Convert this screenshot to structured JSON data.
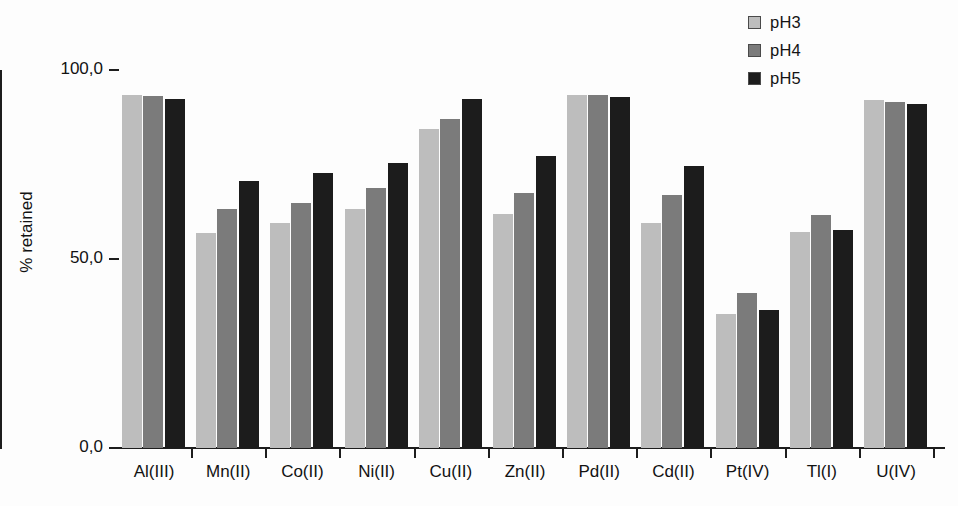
{
  "chart_data": {
    "type": "bar",
    "title": "",
    "xlabel": "",
    "ylabel": "% retained",
    "ylim": [
      0,
      100
    ],
    "ytick_labels": [
      "0,0",
      "50,0",
      "100,0"
    ],
    "ytick_values": [
      0,
      50,
      100
    ],
    "grid": false,
    "legend_position": "top-right",
    "categories": [
      "Al(III)",
      "Mn(II)",
      "Co(II)",
      "Ni(II)",
      "Cu(II)",
      "Zn(II)",
      "Pd(II)",
      "Cd(II)",
      "Pt(IV)",
      "Tl(I)",
      "U(IV)"
    ],
    "series": [
      {
        "name": "pH3",
        "color": "#bdbdbd",
        "values": [
          93.4,
          56.9,
          59.5,
          63.2,
          84.4,
          61.9,
          93.4,
          59.5,
          35.4,
          57.1,
          92.0
        ]
      },
      {
        "name": "pH4",
        "color": "#7b7b7b",
        "values": [
          93.0,
          63.2,
          64.8,
          68.8,
          87.0,
          67.5,
          93.4,
          66.9,
          41.0,
          61.6,
          91.5
        ]
      },
      {
        "name": "pH5",
        "color": "#1c1c1c",
        "values": [
          92.3,
          70.6,
          72.8,
          75.4,
          92.3,
          77.2,
          92.9,
          74.6,
          36.5,
          57.7,
          91.0
        ]
      }
    ]
  },
  "legend": {
    "items": [
      {
        "label": "pH3",
        "swatch": "#bdbdbd"
      },
      {
        "label": "pH4",
        "swatch": "#7b7b7b"
      },
      {
        "label": "pH5",
        "swatch": "#1c1c1c"
      }
    ]
  },
  "axes": {
    "y_title": "% retained"
  }
}
